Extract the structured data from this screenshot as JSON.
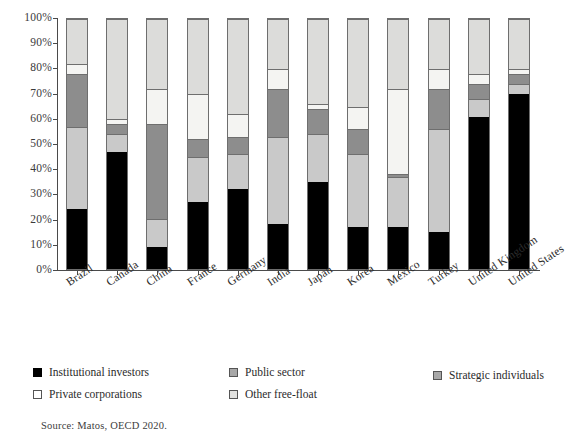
{
  "chart_data": {
    "type": "bar",
    "subtype": "stacked-bar-100-percent",
    "title": "",
    "xlabel": "",
    "ylabel": "",
    "ylim": [
      0,
      100
    ],
    "ytick_labels": [
      "0%",
      "10%",
      "20%",
      "30%",
      "40%",
      "50%",
      "60%",
      "70%",
      "80%",
      "90%",
      "100%"
    ],
    "ytick_values": [
      0,
      10,
      20,
      30,
      40,
      50,
      60,
      70,
      80,
      90,
      100
    ],
    "grid": false,
    "legend_position": "bottom",
    "stack_order_bottom_to_top": [
      "Institutional investors",
      "Strategic individuals",
      "Public sector",
      "Private corporations",
      "Other free-float"
    ],
    "categories": [
      "Brazil",
      "Canada",
      "China",
      "France",
      "Germany",
      "India",
      "Japan",
      "Korea",
      "Mexico",
      "Turkey",
      "United Kingdom",
      "United States"
    ],
    "series": [
      {
        "name": "Institutional investors",
        "color": "#000000",
        "values": [
          24,
          47,
          9,
          27,
          32,
          18,
          35,
          17,
          17,
          15,
          61,
          70
        ]
      },
      {
        "name": "Strategic individuals",
        "color": "#c9c9c9",
        "values": [
          33,
          7,
          11,
          18,
          14,
          35,
          19,
          29,
          20,
          41,
          7,
          4
        ]
      },
      {
        "name": "Public sector",
        "color": "#8d8d8d",
        "values": [
          21,
          4,
          38,
          7,
          7,
          19,
          10,
          10,
          1,
          16,
          6,
          4
        ]
      },
      {
        "name": "Private corporations",
        "color": "#f4f4f2",
        "values": [
          4,
          2,
          14,
          18,
          9,
          8,
          2,
          9,
          34,
          8,
          4,
          2
        ]
      },
      {
        "name": "Other free-float",
        "color": "#dcdcda",
        "values": [
          18,
          40,
          28,
          30,
          38,
          20,
          34,
          35,
          28,
          20,
          22,
          20
        ]
      }
    ],
    "source_note": "Source: Matos, OECD 2020."
  },
  "legend": {
    "items": [
      {
        "label": "Institutional investors",
        "swatch": "institutional"
      },
      {
        "label": "Public sector",
        "swatch": "public"
      },
      {
        "label": "Strategic individuals",
        "swatch": "strategic"
      },
      {
        "label": "Private corporations",
        "swatch": "private"
      },
      {
        "label": "Other free-float",
        "swatch": "freefloat"
      }
    ]
  },
  "source": {
    "text": "Source: Matos, OECD 2020."
  }
}
